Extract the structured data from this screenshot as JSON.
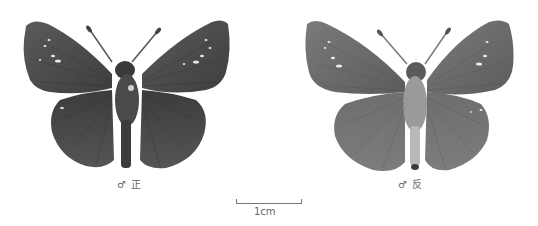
{
  "specimens": [
    {
      "view": "dorsal",
      "sex_symbol": "♂",
      "side_label": "正",
      "caption": "♂ 正"
    },
    {
      "view": "ventral",
      "sex_symbol": "♂",
      "side_label": "反",
      "caption": "♂ 反"
    }
  ],
  "scale_bar": {
    "label": "1cm"
  },
  "colors": {
    "background": "#ffffff",
    "wing_dark": "#4a4a4a",
    "wing_mid": "#6b6b6b",
    "wing_ventral": "#7a7a7a",
    "spots": "#e8e8e8",
    "text": "#666666"
  }
}
